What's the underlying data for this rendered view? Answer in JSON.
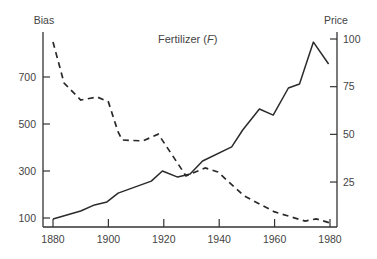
{
  "chart_data": {
    "type": "line",
    "title": "Fertilizer (F)",
    "title_main": "Fertilizer (",
    "title_var": "F",
    "title_end": ")",
    "xlabel": "",
    "ylabel_left": "Bias",
    "ylabel_right": "Price",
    "xlim": [
      1880,
      1980
    ],
    "ylim_left": [
      60,
      880
    ],
    "ylim_right": [
      0,
      105
    ],
    "x_ticks": [
      1880,
      1900,
      1920,
      1940,
      1960,
      1980
    ],
    "x_tick_labels": [
      "1880",
      "1900",
      "1920",
      "1940",
      "1960",
      "1980"
    ],
    "y_left_ticks": [
      100,
      300,
      500,
      700
    ],
    "y_left_tick_labels": [
      "100",
      "300",
      "500",
      "700"
    ],
    "y_right_ticks": [
      25,
      50,
      75,
      100
    ],
    "y_right_tick_labels": [
      "25",
      "50",
      "75",
      "100"
    ],
    "grid": false,
    "legend": null,
    "series": [
      {
        "name": "Bias",
        "axis": "left",
        "style": "dashed",
        "x": [
          1880,
          1884,
          1890,
          1896,
          1900,
          1903.5,
          1905,
          1912.5,
          1918,
          1928,
          1935,
          1939.5,
          1949,
          1960,
          1971,
          1975,
          1980
        ],
        "values": [
          849,
          674,
          602,
          615,
          594,
          466,
          432,
          428,
          457,
          279,
          313,
          296,
          194,
          126,
          87,
          96,
          79
        ]
      },
      {
        "name": "Price",
        "axis": "right",
        "style": "solid",
        "x": [
          1880,
          1890,
          1895,
          1899.5,
          1903.5,
          1915.5,
          1919.5,
          1925,
          1929.5,
          1934,
          1944.5,
          1948.5,
          1954.5,
          1959.5,
          1965,
          1969,
          1974,
          1979.5
        ],
        "values": [
          5.6,
          9.8,
          13,
          14.6,
          19.2,
          25.5,
          30.8,
          27.6,
          29.2,
          36,
          43.4,
          52.3,
          63.3,
          60.1,
          74.3,
          76.4,
          98.4,
          86.9
        ]
      }
    ]
  }
}
